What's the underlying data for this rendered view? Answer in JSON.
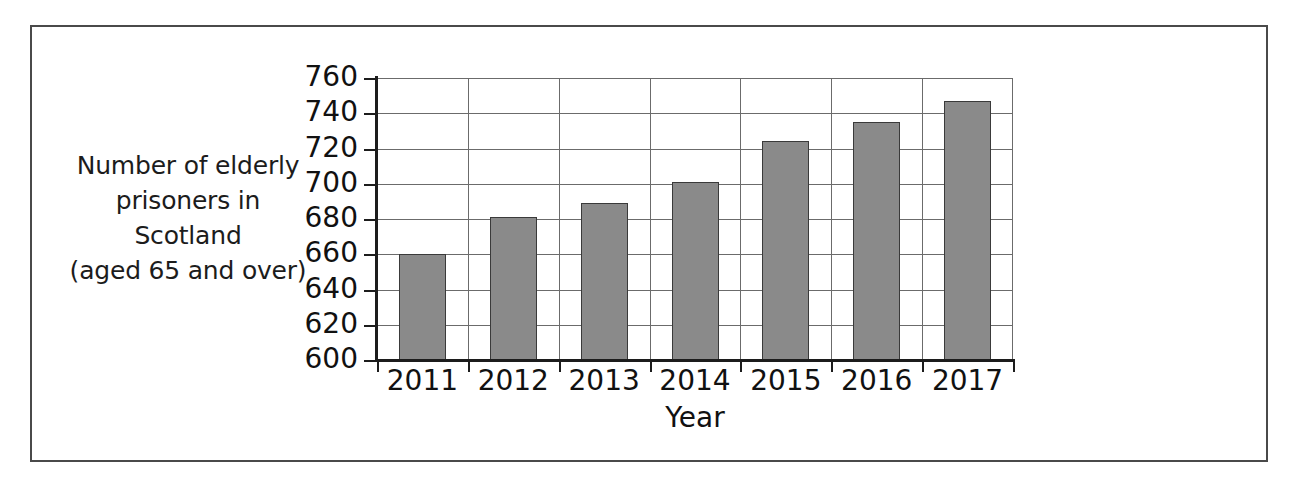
{
  "chart_data": {
    "type": "bar",
    "title": "",
    "subtitle": "",
    "xlabel": "Year",
    "ylabel": "Number of elderly prisoners in Scotland (aged 65 and over)",
    "ylabel_lines": [
      "Number of elderly",
      "prisoners in",
      "Scotland",
      "(aged 65 and over)"
    ],
    "categories": [
      "2011",
      "2012",
      "2013",
      "2014",
      "2015",
      "2016",
      "2017"
    ],
    "values": [
      660,
      681,
      689,
      701,
      724,
      735,
      747
    ],
    "series": [
      {
        "name": "Number of elderly prisoners in Scotland (aged 65 and over)",
        "values": [
          660,
          681,
          689,
          701,
          724,
          735,
          747
        ]
      }
    ],
    "ylim": [
      600,
      760
    ],
    "ytick_labels": [
      "760",
      "740",
      "720",
      "700",
      "680",
      "660",
      "640",
      "620",
      "600"
    ],
    "ytick_values": [
      760,
      740,
      720,
      700,
      680,
      660,
      640,
      620,
      600
    ],
    "ytick_step": 20,
    "grid": "both",
    "legend": "none",
    "bar_color": "#8a8a8a",
    "bar_edge_color": "#3a3a3a",
    "axis_color": "#1c1c1c",
    "grid_color": "#6b6b6b",
    "frame_color": "#4a4a4a",
    "background_color": "#ffffff"
  }
}
